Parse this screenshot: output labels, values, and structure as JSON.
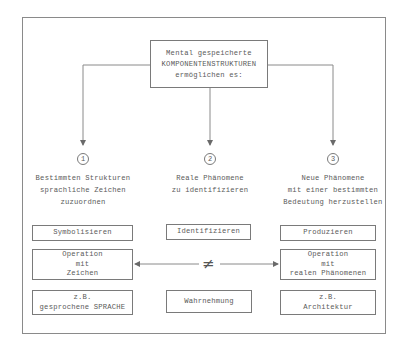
{
  "top_box": {
    "lines": [
      "Mental gespeicherte",
      "KOMPONENTENSTRUKTUREN",
      "ermöglichen es:"
    ]
  },
  "branches": [
    {
      "number": "1",
      "description": [
        "Bestimmten Strukturen",
        "sprachliche Zeichen",
        "zuzuordnen"
      ],
      "action": "Symbolisieren",
      "operation": [
        "Operation",
        "mit",
        "Zeichen"
      ],
      "example": [
        "z.B.",
        "gesprochene SPRACHE"
      ]
    },
    {
      "number": "2",
      "description": [
        "Reale Phänomene",
        "zu identifizieren"
      ],
      "action": "Identifizieren",
      "example": [
        "Wahrnehmung"
      ]
    },
    {
      "number": "3",
      "description": [
        "Neue Phänomene",
        "mit einer bestimmten",
        "Bedeutung herzustellen"
      ],
      "action": "Produzieren",
      "operation": [
        "Operation",
        "mit",
        "realen Phänomenen"
      ],
      "example": [
        "z.B.",
        "Architektur"
      ]
    }
  ],
  "relation": {
    "symbol": "≠",
    "meaning": "not-equal"
  },
  "colors": {
    "line": "#7a7a7a",
    "text": "#5a5a5a",
    "background": "#ffffff"
  }
}
